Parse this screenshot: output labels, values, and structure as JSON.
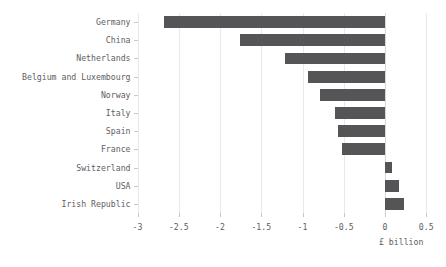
{
  "chart_data": {
    "type": "bar",
    "orientation": "horizontal",
    "title": "",
    "xlabel": "£ billion",
    "ylabel": "",
    "xlim": [
      -3,
      0.5
    ],
    "ylim": null,
    "grid": true,
    "legend": null,
    "bar_color": "#555558",
    "categories": [
      "Germany",
      "China",
      "Netherlands",
      "Belgium and Luxembourg",
      "Norway",
      "Italy",
      "Spain",
      "France",
      "Switzerland",
      "USA",
      "Irish Republic"
    ],
    "values": [
      -2.68,
      -1.76,
      -1.21,
      -0.93,
      -0.79,
      -0.61,
      -0.57,
      -0.52,
      0.09,
      0.17,
      0.23
    ],
    "xticks": [
      -3,
      -2.5,
      -2,
      -1.5,
      -1,
      -0.5,
      0,
      0.5
    ],
    "xtick_labels": [
      "-3",
      "-2.5",
      "-2",
      "-1.5",
      "-1",
      "-0.5",
      "0",
      "0.5"
    ]
  },
  "axis": {
    "x_title": "£ billion"
  }
}
